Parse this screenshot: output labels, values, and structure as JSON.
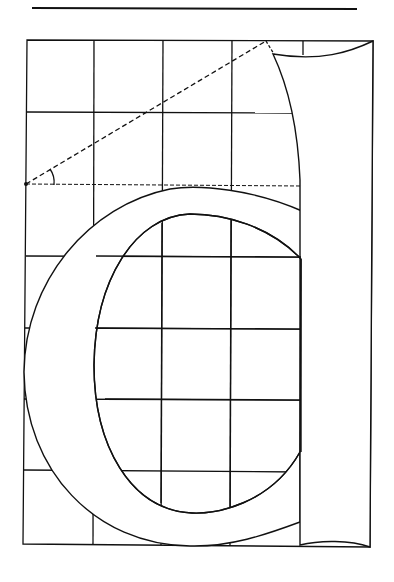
{
  "diagram": {
    "letter": "d",
    "colors": {
      "background": "#ffffff",
      "ink": "#111111"
    },
    "top_rule": {
      "x1": 32,
      "y1": 8,
      "x2": 357,
      "y2": 9
    },
    "grid": {
      "columns_x": [
        26,
        94,
        162,
        231,
        300,
        371
      ],
      "rows_y": [
        40,
        112,
        184,
        256,
        328,
        399,
        470,
        545
      ],
      "cols": 5,
      "rows": 7
    },
    "construction_lines": {
      "diagonal": {
        "from": [
          26,
          184
        ],
        "to": [
          266,
          41
        ],
        "style": "dashed"
      },
      "baseline": {
        "from": [
          26,
          185
        ],
        "to": [
          302,
          186
        ],
        "style": "dashed"
      },
      "angle_arc": {
        "center": [
          26,
          184
        ],
        "radius": 27
      }
    }
  }
}
